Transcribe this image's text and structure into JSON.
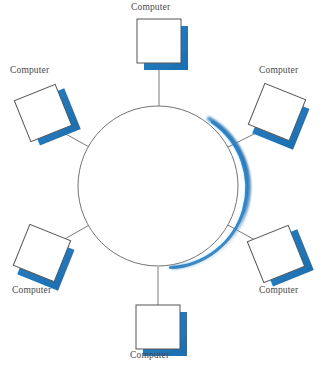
{
  "diagram": {
    "type": "network-topology",
    "topology_name": "ring",
    "canvas": {
      "width": 323,
      "height": 368,
      "background": "#ffffff"
    },
    "colors": {
      "node_fill": "#ffffff",
      "node_stroke": "#555555",
      "node_shadow_blue": "#2b7fc0",
      "node_shadow_blue_light": "#6aa9d8",
      "ring_stroke": "#6b6b6b",
      "ring_shadow_blue": "#2a7ec0",
      "connector_stroke": "#6b6b6b",
      "label_text": "#4a4a4a"
    },
    "ring": {
      "center_x": 158,
      "center_y": 186,
      "radius": 80,
      "stroke_width": 1,
      "shadow_arc_start_deg": -55,
      "shadow_arc_end_deg": 95
    },
    "nodes": [
      {
        "id": "computer-top",
        "label": "Computer",
        "position": "top",
        "angle_deg": 270,
        "square_cx": 159,
        "square_cy": 41,
        "size": 44,
        "rotation_deg": 0,
        "label_x": 131,
        "label_y": 3
      },
      {
        "id": "computer-top-right",
        "label": "Computer",
        "position": "top-right",
        "angle_deg": 330,
        "square_cx": 277,
        "square_cy": 112,
        "size": 44,
        "rotation_deg": 22,
        "label_x": 258,
        "label_y": 66
      },
      {
        "id": "computer-bottom-right",
        "label": "Computer",
        "position": "bottom-right",
        "angle_deg": 30,
        "square_cx": 276,
        "square_cy": 254,
        "size": 44,
        "rotation_deg": -22,
        "label_x": 258,
        "label_y": 286
      },
      {
        "id": "computer-bottom",
        "label": "Computer",
        "position": "bottom",
        "angle_deg": 90,
        "square_cx": 158,
        "square_cy": 327,
        "size": 44,
        "rotation_deg": 0,
        "label_x": 131,
        "label_y": 351
      },
      {
        "id": "computer-bottom-left",
        "label": "Computer",
        "position": "bottom-left",
        "angle_deg": 150,
        "square_cx": 42,
        "square_cy": 253,
        "size": 44,
        "rotation_deg": 22,
        "label_x": 12,
        "label_y": 286
      },
      {
        "id": "computer-top-left",
        "label": "Computer",
        "position": "top-left",
        "angle_deg": 210,
        "square_cx": 43,
        "square_cy": 113,
        "size": 44,
        "rotation_deg": -22,
        "label_x": 9,
        "label_y": 66
      }
    ],
    "connectors": [
      {
        "id": "link-top",
        "x1": 159,
        "y1": 64,
        "x2": 159,
        "y2": 106
      },
      {
        "id": "link-top-right",
        "x1": 253,
        "y1": 131,
        "x2": 227,
        "y2": 147
      },
      {
        "id": "link-bottom-right",
        "x1": 252,
        "y1": 239,
        "x2": 226,
        "y2": 224
      },
      {
        "id": "link-bottom",
        "x1": 158,
        "y1": 305,
        "x2": 158,
        "y2": 267
      },
      {
        "id": "link-bottom-left",
        "x1": 66,
        "y1": 239,
        "x2": 90,
        "y2": 224
      },
      {
        "id": "link-top-left",
        "x1": 67,
        "y1": 131,
        "x2": 90,
        "y2": 147
      }
    ]
  }
}
